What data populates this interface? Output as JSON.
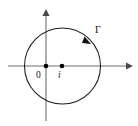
{
  "figure": {
    "background_color": "#ffffff",
    "width": 138,
    "height": 126
  },
  "axes": {
    "horizontal": {
      "name": "real-axis",
      "y": 66,
      "x_start": 8,
      "x_end": 131,
      "arrow_at": "right",
      "color": "#6e6e6e"
    },
    "vertical": {
      "name": "imaginary-axis",
      "x": 46,
      "y_start": 10,
      "y_end": 121,
      "arrow_at": "top",
      "color": "#6e6e6e"
    }
  },
  "contour": {
    "name": "circle-contour",
    "label": "Γ",
    "center_x": 62.5,
    "center_y": 66,
    "radius": 38,
    "color": "#1a1a1a",
    "orientation": "clockwise",
    "direction_marker_angle_deg": 45
  },
  "points": [
    {
      "id": "origin",
      "label": "0",
      "x": 46,
      "y": 66,
      "color": "#000000"
    },
    {
      "id": "i",
      "label": "i",
      "x": 62,
      "y": 66,
      "color": "#000000"
    }
  ],
  "labels": {
    "origin": "0",
    "center": "i",
    "contour": "Γ"
  }
}
